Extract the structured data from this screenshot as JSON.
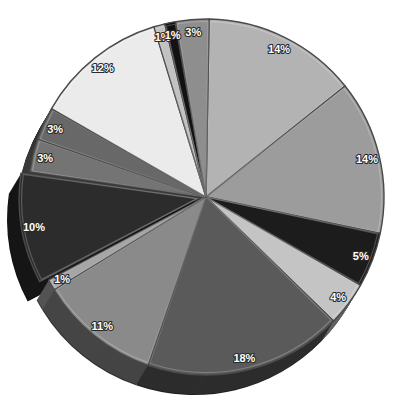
{
  "chart_data": {
    "type": "pie",
    "title": "",
    "xlabel": "",
    "ylabel": "",
    "legend": "none",
    "style": "3d-grayscale",
    "start_angle_deg": -89,
    "exploded_index": 7,
    "values": [
      14,
      14,
      5,
      4,
      18,
      11,
      1,
      10,
      3,
      3,
      12,
      1,
      1,
      3
    ],
    "slices": [
      {
        "label": "14%",
        "value": 14,
        "color": "#b3b3b3"
      },
      {
        "label": "14%",
        "value": 14,
        "color": "#9c9c9c"
      },
      {
        "label": "5%",
        "value": 5,
        "color": "#1c1c1c"
      },
      {
        "label": "4%",
        "value": 4,
        "color": "#c4c4c4"
      },
      {
        "label": "18%",
        "value": 18,
        "color": "#5a5a5a"
      },
      {
        "label": "11%",
        "value": 11,
        "color": "#8a8a8a"
      },
      {
        "label": "1%",
        "value": 1,
        "color": "#a6a6a6"
      },
      {
        "label": "10%",
        "value": 10,
        "color": "#2c2c2c"
      },
      {
        "label": "3%",
        "value": 3,
        "color": "#747474"
      },
      {
        "label": "3%",
        "value": 3,
        "color": "#686868"
      },
      {
        "label": "12%",
        "value": 12,
        "color": "#ebebeb"
      },
      {
        "label": "1%",
        "value": 1,
        "color": "#c2c2c2"
      },
      {
        "label": "1%",
        "value": 1,
        "color": "#121212"
      },
      {
        "label": "3%",
        "value": 3,
        "color": "#8e8e8e"
      }
    ]
  }
}
